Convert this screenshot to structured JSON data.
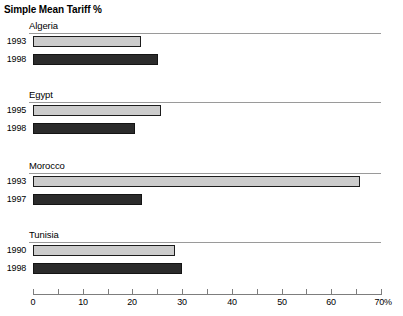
{
  "chart_data": {
    "type": "bar",
    "orientation": "horizontal",
    "title": "Simple Mean Tariff %",
    "xlabel": "",
    "ylabel": "",
    "xlim": [
      0,
      70
    ],
    "xticks": [
      0,
      10,
      20,
      30,
      40,
      50,
      60,
      70
    ],
    "xtick_labels": [
      "0",
      "10",
      "20",
      "30",
      "40",
      "50",
      "60",
      "70%"
    ],
    "minor_tick_interval": 5,
    "grid": false,
    "legend": "none",
    "groups": [
      {
        "name": "Algeria",
        "bars": [
          {
            "label": "1993",
            "value": 21.7,
            "style": "light"
          },
          {
            "label": "1998",
            "value": 25.1,
            "style": "dark"
          }
        ]
      },
      {
        "name": "Egypt",
        "bars": [
          {
            "label": "1995",
            "value": 25.7,
            "style": "light"
          },
          {
            "label": "1998",
            "value": 20.6,
            "style": "dark"
          }
        ]
      },
      {
        "name": "Morocco",
        "bars": [
          {
            "label": "1993",
            "value": 65.8,
            "style": "light"
          },
          {
            "label": "1997",
            "value": 21.9,
            "style": "dark"
          }
        ]
      },
      {
        "name": "Tunisia",
        "bars": [
          {
            "label": "1990",
            "value": 28.5,
            "style": "light"
          },
          {
            "label": "1998",
            "value": 30.0,
            "style": "dark"
          }
        ]
      }
    ],
    "colors": {
      "light_bar": "#cccccc",
      "dark_bar": "#2b2b2b",
      "bar_border": "#1c1c1c",
      "axis": "#7d7d7d",
      "rule": "#9a9a9a",
      "text": "#000000",
      "background": "#ffffff"
    }
  }
}
